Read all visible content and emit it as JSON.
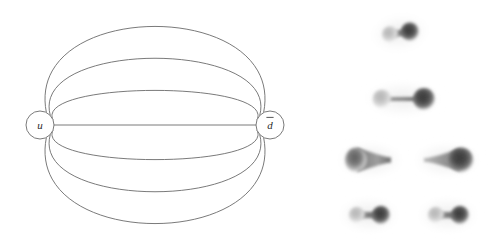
{
  "figure": {
    "title": "",
    "background_color": "#ffffff",
    "panels": [
      {
        "id": "multigraph-panel",
        "name": "quark-antiquark-multigraph",
        "description": "Multigraph with two labelled vertices joined by seven parallel edges"
      },
      {
        "id": "flux-tube-panel",
        "name": "flux-tube-density-plots",
        "description": "Grayscale action-density plots of quark-antiquark flux tubes"
      }
    ]
  },
  "graph": {
    "stroke_color": "#6b6b6b",
    "node_fill": "#ffffff",
    "label_color": "#2b2b2b",
    "nodes": [
      {
        "id": "node-u",
        "label": "u",
        "overline": false,
        "cx": 40,
        "cy": 125,
        "r": 14
      },
      {
        "id": "node-dbar",
        "label": "d",
        "overline": true,
        "cx": 270,
        "cy": 125,
        "r": 14
      }
    ],
    "edge_count": 7,
    "edges": [
      {
        "id": "edge-1",
        "curvature": -86,
        "side": "top",
        "label": ""
      },
      {
        "id": "edge-2",
        "curvature": -58,
        "side": "top",
        "label": ""
      },
      {
        "id": "edge-3",
        "curvature": -30,
        "side": "top",
        "label": ""
      },
      {
        "id": "edge-4",
        "curvature": 0,
        "side": "middle",
        "label": ""
      },
      {
        "id": "edge-5",
        "curvature": 30,
        "side": "bottom",
        "label": ""
      },
      {
        "id": "edge-6",
        "curvature": 58,
        "side": "bottom",
        "label": ""
      },
      {
        "id": "edge-7",
        "curvature": 86,
        "side": "bottom",
        "label": ""
      }
    ]
  },
  "flux_plots": {
    "colormap": "grayscale",
    "background_color": "#ffffff",
    "tiles": [
      {
        "id": "flux-tile-1",
        "row": 1,
        "column": 1,
        "cx": 400,
        "cy": 33,
        "shape": "dumbbell",
        "left_lobe": "light",
        "right_lobe": "dark",
        "separation": 20,
        "tilt_deg": -8
      },
      {
        "id": "flux-tile-2",
        "row": 2,
        "column": 1,
        "cx": 403,
        "cy": 99,
        "shape": "stretched-dumbbell",
        "left_lobe": "light",
        "right_lobe": "dark",
        "separation": 42,
        "tilt_deg": 0
      },
      {
        "id": "flux-tile-3",
        "row": 3,
        "column": 1,
        "cx": 370,
        "cy": 160,
        "shape": "teardrop-right-tail",
        "left_lobe": "dark",
        "right_lobe": "tail",
        "separation": 30,
        "tilt_deg": 0
      },
      {
        "id": "flux-tile-4",
        "row": 3,
        "column": 2,
        "cx": 447,
        "cy": 160,
        "shape": "teardrop-left-tail",
        "left_lobe": "tail",
        "right_lobe": "dark",
        "separation": 30,
        "tilt_deg": 0
      },
      {
        "id": "flux-tile-5",
        "row": 4,
        "column": 1,
        "cx": 369,
        "cy": 215,
        "shape": "dumbbell",
        "left_lobe": "light",
        "right_lobe": "dark",
        "separation": 24,
        "tilt_deg": 0
      },
      {
        "id": "flux-tile-6",
        "row": 4,
        "column": 2,
        "cx": 448,
        "cy": 215,
        "shape": "dumbbell",
        "left_lobe": "light",
        "right_lobe": "dark",
        "separation": 24,
        "tilt_deg": 0
      }
    ]
  }
}
